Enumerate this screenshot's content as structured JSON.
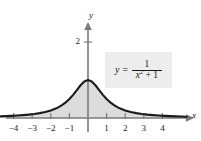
{
  "figure": {
    "background_color": "#ffffff",
    "curve_color": "#1a1a1a",
    "fill_color": "#dcdcdc",
    "axis_color": "#7a7a7a",
    "label_box_color": "#ededed"
  },
  "equation_label": {
    "lhs": "y",
    "equals": "=",
    "numerator": "1",
    "denominator_var": "x",
    "denominator_exponent": "2",
    "denominator_op": "+",
    "denominator_const": "1"
  },
  "axes": {
    "x_name": "x",
    "y_name": "y",
    "x_ticks": [
      "−4",
      "−3",
      "−2",
      "−1",
      "1",
      "2",
      "3",
      "4"
    ],
    "y_ticks": [
      "2"
    ]
  },
  "chart_data": {
    "type": "area",
    "title": "",
    "subtitle": "",
    "xlabel": "x",
    "ylabel": "y",
    "equation": "y = 1 / (x^2 + 1)",
    "xlim": [
      -4.7,
      5.5
    ],
    "ylim": [
      -0.35,
      2.65
    ],
    "xticks": [
      -4,
      -3,
      -2,
      -1,
      1,
      2,
      3,
      4
    ],
    "xtick_labels": [
      "−4",
      "−3",
      "−2",
      "−1",
      "1",
      "2",
      "3",
      "4"
    ],
    "yticks": [
      2
    ],
    "ytick_labels": [
      "2"
    ],
    "grid": false,
    "legend": false,
    "fill_between": [
      0,
      1
    ],
    "x": [
      -4.7,
      -4.4,
      -4.1,
      -3.8,
      -3.5,
      -3.2,
      -2.9,
      -2.6,
      -2.3,
      -2.0,
      -1.8,
      -1.6,
      -1.4,
      -1.2,
      -1.0,
      -0.8,
      -0.6,
      -0.4,
      -0.2,
      0.0,
      0.2,
      0.4,
      0.6,
      0.8,
      1.0,
      1.2,
      1.4,
      1.6,
      1.8,
      2.0,
      2.3,
      2.6,
      2.9,
      3.2,
      3.5,
      3.8,
      4.1,
      4.4,
      4.7,
      5.0,
      5.3
    ],
    "values": [
      0.0433,
      0.0491,
      0.0562,
      0.0648,
      0.0755,
      0.0889,
      0.1062,
      0.1288,
      0.1589,
      0.2,
      0.2358,
      0.2809,
      0.3378,
      0.4098,
      0.5,
      0.6098,
      0.7353,
      0.8621,
      0.9615,
      1.0,
      0.9615,
      0.8621,
      0.7353,
      0.6098,
      0.5,
      0.4098,
      0.3378,
      0.2809,
      0.2358,
      0.2,
      0.1589,
      0.1288,
      0.1062,
      0.0889,
      0.0755,
      0.0648,
      0.0562,
      0.0491,
      0.0433,
      0.0385,
      0.0344
    ]
  },
  "layout": {
    "origin_x": 88,
    "origin_y": 118,
    "unit_x": 18.6,
    "unit_y": 38
  }
}
